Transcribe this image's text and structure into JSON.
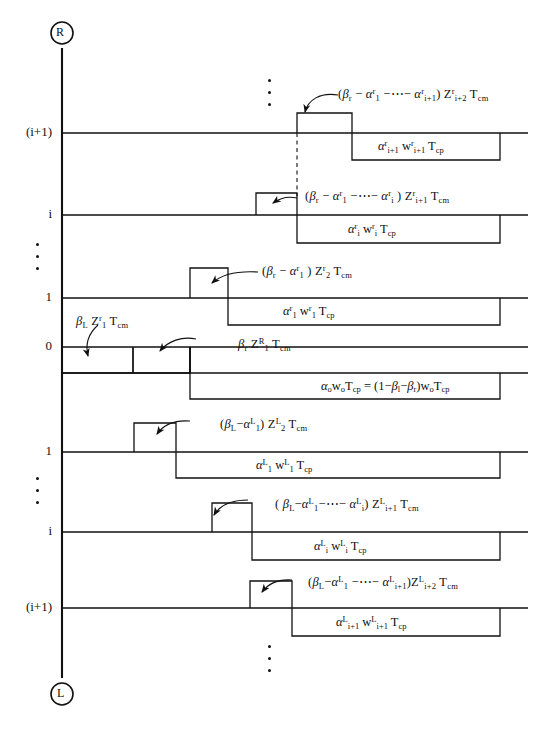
{
  "figure": {
    "type": "timing-waveform-diagram",
    "axis": {
      "name": "vertical-index-axis",
      "top_endpoint_label": "R",
      "bottom_endpoint_label": "L",
      "tick_labels": [
        "(i+1)",
        "i",
        "1",
        "0",
        "1",
        "i",
        "(i+1)"
      ],
      "ellipsis_groups": 3
    },
    "rows": [
      {
        "id": "r-i-plus-1",
        "side": "R",
        "tick": "(i+1)",
        "pulse_annotation": "(βr − α⁸1 − ⋯ − α⁸i+1) Z⁸i+2 Tcm",
        "box_label": "α⁸i+1 w⁸i+1 Tcp"
      },
      {
        "id": "r-i",
        "side": "R",
        "tick": "i",
        "pulse_annotation": "(βr − α⁸1 − ⋯ − α⁸i) Z⁸i+1 Tcm",
        "box_label": "α⁸i w⁸i Tcp"
      },
      {
        "id": "r-1",
        "side": "R",
        "tick": "1",
        "pulse_annotation": "(βr − α⁸1) Z⁸2 Tcm",
        "box_label": "α⁸1 w⁸1 Tcp"
      },
      {
        "id": "zero",
        "side": "0",
        "tick": "0",
        "left_annotation": "βL Z⁸1 Tcm",
        "right_annotation": "βr Zᴿ1 Tcm",
        "box_label": "α₀w₀Tcp = (1−βl−βr) w₀Tcp"
      },
      {
        "id": "l-1",
        "side": "L",
        "tick": "1",
        "pulse_annotation": "(βL − αᴸ₁) Zᴸ₂ Tcm",
        "box_label": "αᴸ₁ wᴸ₁ Tcp"
      },
      {
        "id": "l-i",
        "side": "L",
        "tick": "i",
        "pulse_annotation": "(βL − αᴸ₁ − ⋯ − αᴸi) Zᴸi+1 Tcm",
        "box_label": "αᴸi wᴸi Tcp"
      },
      {
        "id": "l-i-plus-1",
        "side": "L",
        "tick": "(i+1)",
        "pulse_annotation": "(βL − αᴸ₁ − ⋯ − αᴸi+1) Zᴸi+2 Tcm",
        "box_label": "αᴸi+1 wᴸi+1 Tcp"
      }
    ],
    "colors": {
      "ink": "#111111",
      "background": "#ffffff"
    }
  }
}
